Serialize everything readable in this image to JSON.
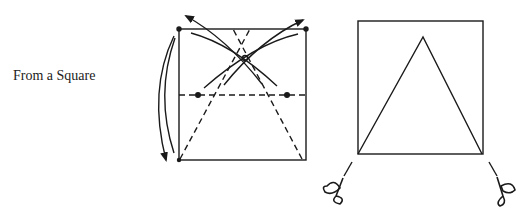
{
  "caption": "From a Square",
  "colors": {
    "ink": "#1a1a1a",
    "background": "#ffffff"
  },
  "figures": [
    {
      "name": "folding-step",
      "description": "Square with dashed horizontal midline fold, dashed triangle diagonals from bottom corners to top center, crease arcs, and curved arrows indicating folding corners to the midline"
    },
    {
      "name": "cut-result",
      "description": "Square with an inscribed equilateral-like triangle from bottom corners to apex; scissors icons at bottom corners indicate cutting"
    }
  ],
  "icons": [
    "scissors-icon-left",
    "scissors-icon-right",
    "fold-arrow-icon"
  ]
}
